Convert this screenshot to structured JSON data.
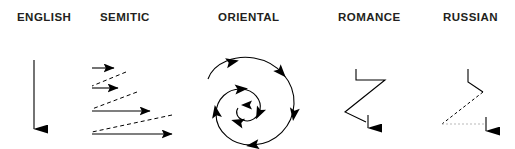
{
  "figure": {
    "background_color": "#ffffff",
    "ink_color": "#231f20",
    "columns": [
      {
        "id": "english",
        "label": "ENGLISH",
        "pattern": "single straight vertical arrow pointing down"
      },
      {
        "id": "semitic",
        "label": "SEMITIC",
        "pattern": "four horizontal arrows of increasing length pointing right, linked by dashed diagonal return sweeps"
      },
      {
        "id": "oriental",
        "label": "ORIENTAL",
        "pattern": "clockwise inward spiral with arrowheads along its path"
      },
      {
        "id": "romance",
        "label": "ROMANCE",
        "pattern": "zigzag path with digression, ending in a downward arrow"
      },
      {
        "id": "russian",
        "label": "RUSSIAN",
        "pattern": "short stroke then long dashed diagonal and dashed horizontal, ending in a downward arrow"
      }
    ]
  }
}
